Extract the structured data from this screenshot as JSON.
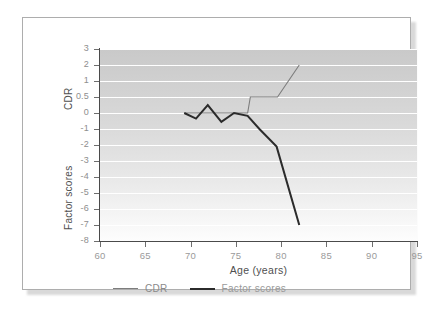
{
  "chart_data": {
    "type": "line",
    "title": "",
    "xlabel": "Age (years)",
    "ylabel_primary": "CDR",
    "ylabel_secondary": "Factor scores",
    "xlim": [
      60,
      95
    ],
    "xticks": [
      60,
      65,
      70,
      75,
      80,
      85,
      90,
      95
    ],
    "xticklabels": [
      "60",
      "65",
      "70",
      "75",
      "80",
      "85",
      "90",
      "95"
    ],
    "yticks": [
      3,
      2,
      1,
      0.5,
      0,
      -1,
      -2,
      -3,
      -4,
      -5,
      -6,
      -7,
      -8
    ],
    "yticklabels": [
      "3",
      "2",
      "1",
      "0.5",
      "0",
      "-1",
      "-2",
      "-3",
      "-4",
      "-5",
      "-6",
      "-7",
      "-8"
    ],
    "y_axis_note": "non-uniform tick spacing: equal pixel spacing between consecutive labels 3,2,1,0.5,0,-1,...,-8",
    "grid": true,
    "grid_color": "#ffffff",
    "plot_background": "vertical gradient light-gray to white",
    "legend_position": "below-axis-left",
    "series": [
      {
        "name": "CDR",
        "color": "#7d7d7d",
        "linewidth": 1.1,
        "x": [
          69.3,
          76.3,
          76.6,
          79.6,
          82.0
        ],
        "values": [
          0,
          0,
          0.5,
          0.5,
          2.0
        ]
      },
      {
        "name": "Factor scores",
        "color": "#2b2b2b",
        "linewidth": 2.0,
        "x": [
          69.3,
          70.6,
          71.9,
          73.4,
          74.8,
          76.3,
          77.6,
          79.5,
          82.0
        ],
        "values": [
          0.0,
          -0.35,
          0.25,
          -0.55,
          0.0,
          -0.18,
          -1.0,
          -2.1,
          -7.0
        ]
      }
    ]
  },
  "axes": {
    "x_title": "Age (years)",
    "y_title_upper": "CDR",
    "y_title_lower": "Factor scores"
  },
  "legend": {
    "items": [
      {
        "label": "CDR"
      },
      {
        "label": "Factor scores"
      }
    ]
  },
  "colors": {
    "cdr_line": "#7d7d7d",
    "factor_line": "#2b2b2b",
    "axis": "#4a4a4a",
    "grid": "#ffffff",
    "frame": "#adadad",
    "tick_text": "#8e8e8e"
  }
}
